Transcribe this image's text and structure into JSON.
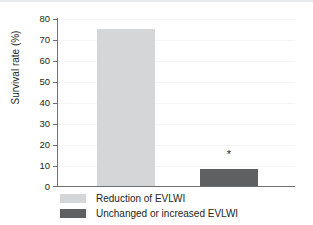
{
  "chart_data": {
    "type": "bar",
    "title": "",
    "xlabel": "",
    "ylabel": "Survival rate (%)",
    "ylim": [
      0,
      80
    ],
    "ytick_step": 10,
    "yticks": [
      80,
      70,
      60,
      50,
      40,
      30,
      20,
      10,
      0
    ],
    "ytick_labels": [
      "80",
      "70",
      "60",
      "50",
      "40",
      "30",
      "20",
      "10",
      "0"
    ],
    "grid": true,
    "legend_position": "bottom-left",
    "categories": [
      "Reduction of EVLWI",
      "Unchanged or increased EVLWI"
    ],
    "values": [
      75,
      8
    ],
    "bars": [
      {
        "label": "Reduction of EVLWI",
        "value": 75,
        "color": "#d5d6d8",
        "annotation": ""
      },
      {
        "label": "Unchanged or increased EVLWI",
        "value": 8,
        "color": "#5f6062",
        "annotation": "*"
      }
    ],
    "annotations": [
      {
        "text": "*",
        "series": "Unchanged or increased EVLWI",
        "meaning": "significance-marker"
      }
    ]
  },
  "axes": {
    "y_title": "Survival rate (%)",
    "tick_labels": [
      "80",
      "70",
      "60",
      "50",
      "40",
      "30",
      "20",
      "10",
      "0"
    ]
  },
  "legend": {
    "items": [
      {
        "label": "Reduction of EVLWI",
        "color": "#d5d6d8"
      },
      {
        "label": "Unchanged or increased EVLWI",
        "color": "#5f6062"
      }
    ]
  },
  "colors": {
    "bar_light": "#d5d6d8",
    "bar_dark": "#5f6062",
    "axis": "#6f7072",
    "text": "#231f20",
    "gridline": "#f4f5f7",
    "background": "#ffffff"
  }
}
